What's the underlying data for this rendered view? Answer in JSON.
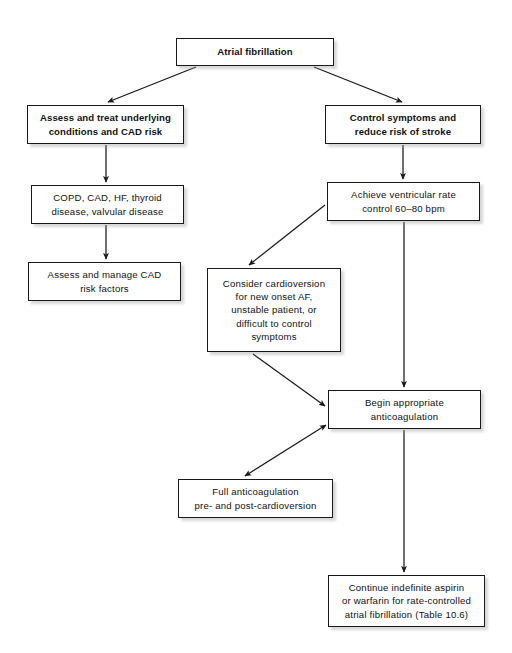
{
  "figure": {
    "kind": "flowchart",
    "page_background": "#ffffff",
    "box_fill": "#ffffff",
    "box_border": "#1a1a1a",
    "arrow_color": "#1a1a1a",
    "text_color": "#121212"
  },
  "nodes": {
    "atrial_fibrillation": {
      "label": "Atrial fibrillation",
      "bold": true,
      "x": 176,
      "y": 38,
      "w": 158,
      "h": 28
    },
    "assess_treat_underlying": {
      "label": "Assess and treat underlying\nconditions and CAD risk",
      "bold": true,
      "x": 27,
      "y": 105,
      "w": 157,
      "h": 39
    },
    "control_symptoms": {
      "label": "Control symptoms and\nreduce risk of stroke",
      "bold": true,
      "x": 325,
      "y": 105,
      "w": 156,
      "h": 39
    },
    "copd_cad_hf": {
      "label": "COPD, CAD, HF, thyroid\ndisease, valvular disease",
      "bold": false,
      "x": 31,
      "y": 185,
      "w": 153,
      "h": 39
    },
    "achieve_ventricular_rate": {
      "label": "Achieve ventricular rate\ncontrol 60–80 bpm",
      "bold": false,
      "x": 327,
      "y": 182,
      "w": 153,
      "h": 39
    },
    "assess_manage_cad": {
      "label": "Assess and manage CAD\nrisk factors",
      "bold": false,
      "x": 28,
      "y": 262,
      "w": 153,
      "h": 39
    },
    "consider_cardioversion": {
      "label": "Consider cardioversion\nfor new onset AF,\nunstable patient, or\ndifficult to control\nsymptoms",
      "bold": false,
      "x": 207,
      "y": 268,
      "w": 134,
      "h": 84
    },
    "begin_anticoagulation": {
      "label": "Begin appropriate\nanticoagulation",
      "bold": false,
      "x": 328,
      "y": 390,
      "w": 153,
      "h": 39
    },
    "full_anticoagulation": {
      "label": "Full anticoagulation\npre- and post-cardioversion",
      "bold": false,
      "x": 178,
      "y": 479,
      "w": 155,
      "h": 39
    },
    "continue_indefinite": {
      "label": "Continue indefinite aspirin\nor warfarin for rate-controlled\natrial fibrillation (Table 10.6)",
      "bold": false,
      "x": 328,
      "y": 575,
      "w": 157,
      "h": 52
    }
  },
  "edges": [
    {
      "name": "af-to-assess-treat",
      "from": "atrial_fibrillation",
      "to": "assess_treat_underlying",
      "style": "diagonal",
      "heads": "end",
      "x1": 196,
      "y1": 67,
      "x2": 108,
      "y2": 102
    },
    {
      "name": "af-to-control-symptoms",
      "from": "atrial_fibrillation",
      "to": "control_symptoms",
      "style": "diagonal",
      "heads": "end",
      "x1": 314,
      "y1": 67,
      "x2": 402,
      "y2": 102
    },
    {
      "name": "assess-treat-to-copd",
      "from": "assess_treat_underlying",
      "to": "copd_cad_hf",
      "style": "vertical",
      "heads": "end",
      "x1": 106,
      "y1": 145,
      "x2": 106,
      "y2": 182
    },
    {
      "name": "copd-to-assess-manage",
      "from": "copd_cad_hf",
      "to": "assess_manage_cad",
      "style": "vertical",
      "heads": "end",
      "x1": 106,
      "y1": 225,
      "x2": 106,
      "y2": 259
    },
    {
      "name": "control-symptoms-to-achieve-rate",
      "from": "control_symptoms",
      "to": "achieve_ventricular_rate",
      "style": "vertical",
      "heads": "end",
      "x1": 403,
      "y1": 145,
      "x2": 403,
      "y2": 179
    },
    {
      "name": "achieve-rate-to-cardioversion",
      "from": "achieve_ventricular_rate",
      "to": "consider_cardioversion",
      "style": "diagonal",
      "heads": "end",
      "x1": 325,
      "y1": 205,
      "x2": 249,
      "y2": 265
    },
    {
      "name": "achieve-rate-to-begin-anticoagulation",
      "from": "achieve_ventricular_rate",
      "to": "begin_anticoagulation",
      "style": "vertical",
      "heads": "end",
      "x1": 404,
      "y1": 222,
      "x2": 404,
      "y2": 387
    },
    {
      "name": "cardioversion-to-begin-anticoagulation",
      "from": "consider_cardioversion",
      "to": "begin_anticoagulation",
      "style": "diagonal",
      "heads": "end",
      "x1": 253,
      "y1": 354,
      "x2": 325,
      "y2": 406
    },
    {
      "name": "begin-anticoagulation-full-anticoagulation",
      "from": "begin_anticoagulation",
      "to": "full_anticoagulation",
      "style": "diagonal",
      "heads": "both",
      "x1": 326,
      "y1": 425,
      "x2": 245,
      "y2": 476
    },
    {
      "name": "begin-anticoagulation-to-continue",
      "from": "begin_anticoagulation",
      "to": "continue_indefinite",
      "style": "vertical",
      "heads": "end",
      "x1": 404,
      "y1": 430,
      "x2": 404,
      "y2": 572
    }
  ]
}
